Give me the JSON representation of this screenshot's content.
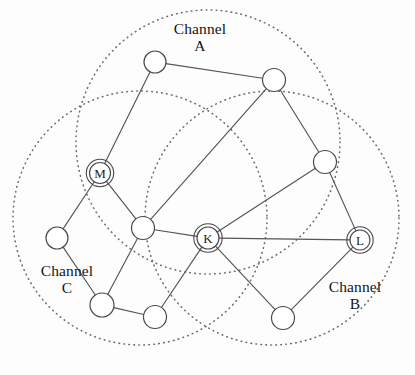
{
  "figure": {
    "type": "network-coverage-diagram",
    "background": "#fdfdfd",
    "width": 415,
    "height": 375
  },
  "channels": [
    {
      "id": "A",
      "name_line1": "Channel",
      "name_line2": "A",
      "cx": 208,
      "cy": 142,
      "r": 132,
      "label_position": "top-center"
    },
    {
      "id": "C",
      "name_line1": "Channel",
      "name_line2": "C",
      "cx": 140,
      "cy": 218,
      "r": 127,
      "label_position": "bottom-left"
    },
    {
      "id": "B",
      "name_line1": "Channel",
      "name_line2": "B",
      "cx": 272,
      "cy": 218,
      "r": 127,
      "label_position": "bottom-right"
    }
  ],
  "style": {
    "node_fill": "#ffffff",
    "node_stroke": "#4a4a4f",
    "edge_stroke": "#55555a",
    "circle_stroke": "#6e6e6e",
    "text_color": "#151515"
  },
  "nodes": [
    {
      "id": "n1",
      "label": "",
      "x": 155,
      "y": 62,
      "r": 11,
      "labeled": false
    },
    {
      "id": "n2",
      "label": "",
      "x": 274,
      "y": 80,
      "r": 11.5,
      "labeled": false
    },
    {
      "id": "M",
      "label": "M",
      "x": 100,
      "y": 173,
      "r": 10.5,
      "labeled": true
    },
    {
      "id": "n4",
      "label": "",
      "x": 325,
      "y": 162,
      "r": 11.5,
      "labeled": false
    },
    {
      "id": "n5",
      "label": "",
      "x": 57,
      "y": 238,
      "r": 11,
      "labeled": false
    },
    {
      "id": "n6",
      "label": "",
      "x": 143,
      "y": 228,
      "r": 11.5,
      "labeled": false
    },
    {
      "id": "K",
      "label": "K",
      "x": 208,
      "y": 238,
      "r": 11,
      "labeled": true
    },
    {
      "id": "L",
      "label": "L",
      "x": 360,
      "y": 240,
      "r": 10,
      "labeled": true
    },
    {
      "id": "n9",
      "label": "",
      "x": 102,
      "y": 305,
      "r": 12,
      "labeled": false
    },
    {
      "id": "n10",
      "label": "",
      "x": 155,
      "y": 317,
      "r": 11.5,
      "labeled": false
    },
    {
      "id": "n11",
      "label": "",
      "x": 283,
      "y": 318,
      "r": 11.5,
      "labeled": false
    }
  ],
  "edges": [
    {
      "from": "n1",
      "to": "n2"
    },
    {
      "from": "n1",
      "to": "M"
    },
    {
      "from": "M",
      "to": "n5"
    },
    {
      "from": "M",
      "to": "n6"
    },
    {
      "from": "n2",
      "to": "n4"
    },
    {
      "from": "n2",
      "to": "n6"
    },
    {
      "from": "n4",
      "to": "L"
    },
    {
      "from": "n4",
      "to": "K"
    },
    {
      "from": "n6",
      "to": "K"
    },
    {
      "from": "n6",
      "to": "n9"
    },
    {
      "from": "n5",
      "to": "n9"
    },
    {
      "from": "n9",
      "to": "n10"
    },
    {
      "from": "n10",
      "to": "K"
    },
    {
      "from": "K",
      "to": "L"
    },
    {
      "from": "K",
      "to": "n11"
    },
    {
      "from": "n11",
      "to": "L"
    }
  ]
}
